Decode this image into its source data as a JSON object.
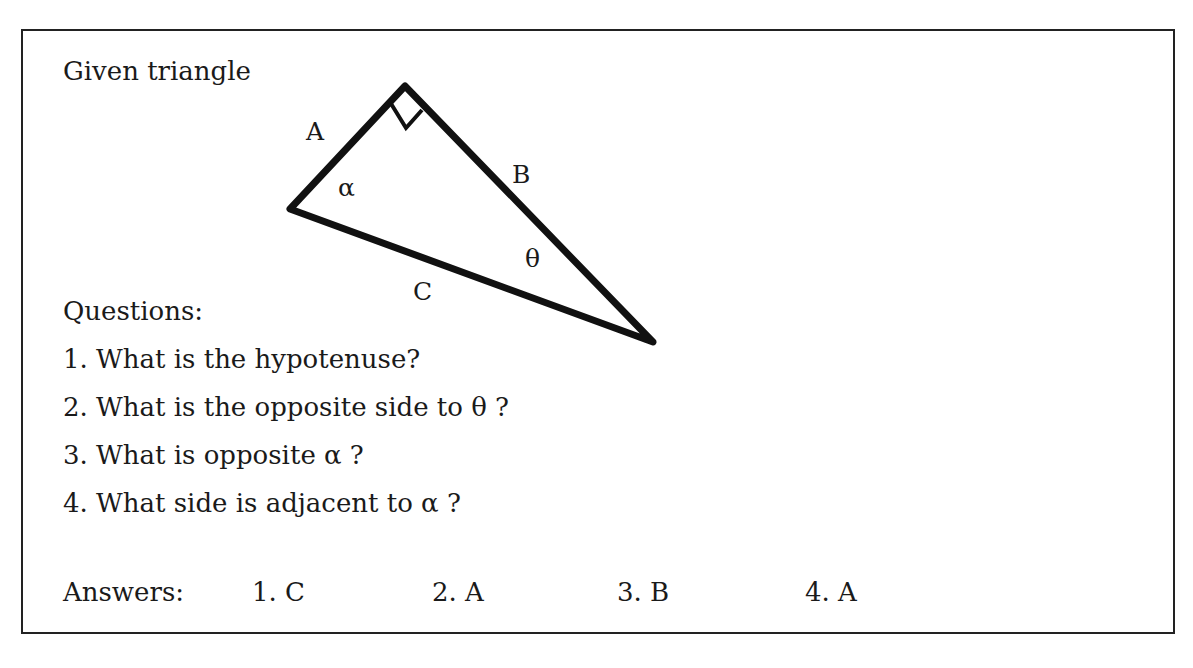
{
  "title": "Given triangle",
  "triangle": {
    "sides": {
      "a": "A",
      "b": "B",
      "c": "C"
    },
    "angles": {
      "alpha": "α",
      "theta": "θ"
    },
    "right_angle_marker": true
  },
  "questions": {
    "heading": "Questions:",
    "items": [
      "1. What is the hypotenuse?",
      "2. What is the opposite side to  θ ?",
      "3. What is opposite  α ?",
      "4. What side is adjacent to  α ?"
    ]
  },
  "answers": {
    "label": "Answers:",
    "items": [
      "1. C",
      "2. A",
      "3. B",
      "4. A"
    ]
  }
}
